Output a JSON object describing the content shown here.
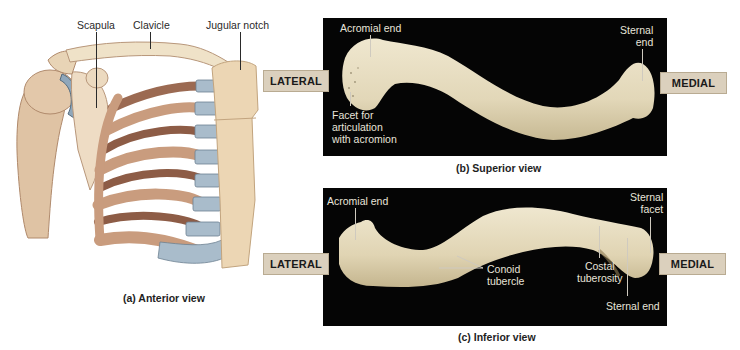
{
  "figure": {
    "panel_a": {
      "caption": "(a) Anterior view",
      "labels": {
        "scapula": "Scapula",
        "clavicle": "Clavicle",
        "jugular_notch": "Jugular notch"
      }
    },
    "panel_b": {
      "caption": "(b) Superior view",
      "labels": {
        "acromial_end": "Acromial end",
        "sternal_end_line1": "Sternal",
        "sternal_end_line2": "end",
        "facet_line1": "Facet for",
        "facet_line2": "articulation",
        "facet_line3": "with acromion"
      },
      "direction_left": "LATERAL",
      "direction_right": "MEDIAL"
    },
    "panel_c": {
      "caption": "(c) Inferior view",
      "labels": {
        "acromial_end": "Acromial end",
        "conoid_line1": "Conoid",
        "conoid_line2": "tubercle",
        "costal_line1": "Costal",
        "costal_line2": "tuberosity",
        "sternal_facet_line1": "Sternal",
        "sternal_facet_line2": "facet",
        "sternal_end": "Sternal end"
      },
      "direction_left": "LATERAL",
      "direction_right": "MEDIAL"
    }
  },
  "colors": {
    "bone": "#e6dcc0",
    "bone_shadow": "#c9bc98",
    "photo_bg": "#050505",
    "cartilage": "#a9bccb",
    "rib": "#c49a7c",
    "rib_dark": "#8a5a44",
    "label_box": "#dbd0bd"
  }
}
